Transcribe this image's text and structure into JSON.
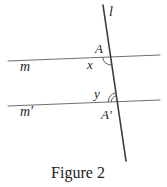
{
  "figure": {
    "caption": "Figure 2",
    "labels": {
      "transversal": "l",
      "line_m": "m",
      "line_m_prime": "m′",
      "point_a": "A",
      "point_a_prime": "A′",
      "angle_x": "x",
      "angle_y": "y"
    },
    "colors": {
      "background": "#ffffff",
      "transversal_line": "#3a3a3a",
      "parallel_lines": "#6f6f6f",
      "angle_arcs": "#4a4a4a",
      "text": "#1f1f1f"
    }
  }
}
